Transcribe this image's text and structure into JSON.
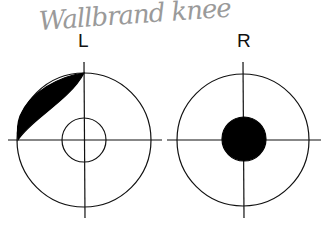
{
  "annotation": {
    "handwritten": "Wallbrand knee"
  },
  "labels": {
    "left": "L",
    "right": "R"
  },
  "diagrams": [
    {
      "side": "L",
      "outer_radius": 67,
      "inner_circle": "outline",
      "inner_radius": 22,
      "shaded_region": "upper-left crescent"
    },
    {
      "side": "R",
      "outer_radius": 66,
      "inner_circle": "filled",
      "inner_radius": 22
    }
  ],
  "colors": {
    "stroke": "#111111",
    "fill": "#000000",
    "handwriting": "#9a9a9a"
  }
}
